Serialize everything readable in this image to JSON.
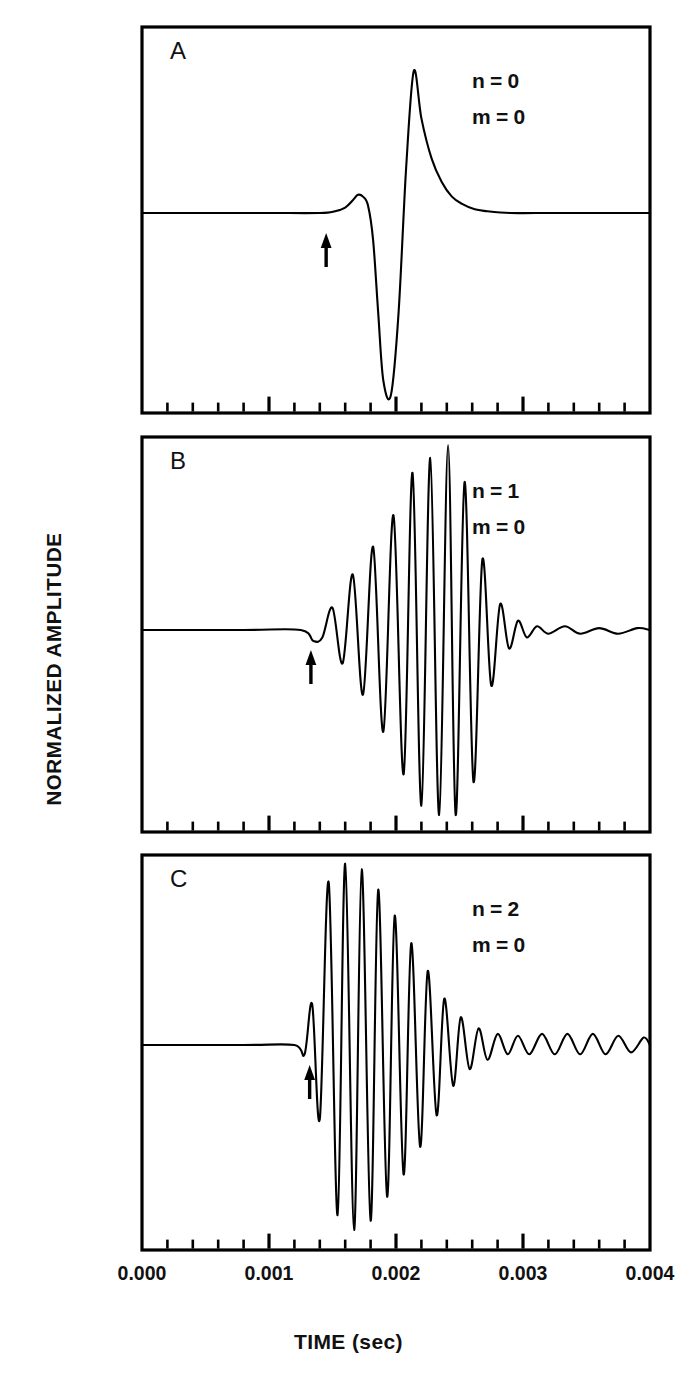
{
  "figure": {
    "axis_titles": {
      "y": "NORMALIZED AMPLITUDE",
      "x": "TIME (sec)"
    }
  },
  "chart_data": {
    "type": "line",
    "title": "",
    "xlabel": "TIME (sec)",
    "ylabel": "NORMALIZED AMPLITUDE",
    "xlim": [
      0.0,
      0.004
    ],
    "ylim": [
      -1.0,
      1.0
    ],
    "grid": false,
    "legend": "none",
    "xticks": [
      "0.000",
      "0.001",
      "0.002",
      "0.003",
      "0.004"
    ],
    "xtick_values": [
      0.0,
      0.001,
      0.002,
      0.003,
      0.004
    ],
    "minor_tick_interval": 0.0002,
    "yticks": [],
    "panels": [
      {
        "letter": "A",
        "n_label": "n = 0",
        "m_label": "m = 0",
        "arrow_time": 0.00145,
        "description": "single bipolar pulse, non-dispersive head wave",
        "x": [
          0.0,
          0.0005,
          0.001,
          0.0014,
          0.00152,
          0.0016,
          0.00166,
          0.0017,
          0.00174,
          0.00178,
          0.00182,
          0.00186,
          0.0019,
          0.00196,
          0.00202,
          0.00208,
          0.00214,
          0.0022,
          0.00228,
          0.00236,
          0.00244,
          0.00252,
          0.00262,
          0.00272,
          0.0029,
          0.0031,
          0.0035,
          0.004
        ],
        "y": [
          0.0,
          0.0,
          0.0,
          0.0,
          0.01,
          0.03,
          0.07,
          0.1,
          0.09,
          0.04,
          -0.15,
          -0.55,
          -0.92,
          -1.0,
          -0.55,
          0.25,
          0.78,
          0.52,
          0.3,
          0.17,
          0.09,
          0.05,
          0.02,
          0.01,
          0.0,
          0.0,
          0.0,
          0.0
        ]
      },
      {
        "letter": "B",
        "n_label": "n = 1",
        "m_label": "m = 0",
        "arrow_time": 0.00133,
        "description": "dispersive wave train, first higher mode, Airy phase near 0.0025 s",
        "envelope_peak_time": 0.00247,
        "x": [
          0.0,
          0.0008,
          0.00125,
          0.00135,
          0.00142,
          0.0015,
          0.00158,
          0.00166,
          0.00174,
          0.00182,
          0.0019,
          0.00198,
          0.00206,
          0.00213,
          0.0022,
          0.00227,
          0.00234,
          0.00241,
          0.00247,
          0.00254,
          0.00261,
          0.00268,
          0.00275,
          0.00282,
          0.00289,
          0.00296,
          0.00303,
          0.00311,
          0.0032,
          0.00333,
          0.00345,
          0.0036,
          0.00375,
          0.0039,
          0.004
        ],
        "y": [
          0.0,
          0.0,
          0.0,
          -0.06,
          -0.04,
          0.12,
          -0.18,
          0.3,
          -0.35,
          0.45,
          -0.55,
          0.62,
          -0.78,
          0.85,
          -0.95,
          0.93,
          -1.0,
          1.0,
          -1.0,
          0.8,
          -0.82,
          0.38,
          -0.3,
          0.14,
          -0.1,
          0.05,
          -0.04,
          0.02,
          -0.02,
          0.02,
          -0.02,
          0.01,
          -0.02,
          0.01,
          0.0
        ]
      },
      {
        "letter": "C",
        "n_label": "n = 2",
        "m_label": "m = 0",
        "arrow_time": 0.00132,
        "description": "dispersive wave train, second higher mode, early Airy phase near 0.0018 s with long low-amplitude coda",
        "envelope_peak_time": 0.0018,
        "x": [
          0.0,
          0.0008,
          0.0012,
          0.00128,
          0.00134,
          0.0014,
          0.00147,
          0.00154,
          0.0016,
          0.00167,
          0.00173,
          0.0018,
          0.00186,
          0.00193,
          0.00199,
          0.00206,
          0.00212,
          0.00219,
          0.00225,
          0.00232,
          0.00238,
          0.00245,
          0.00251,
          0.00258,
          0.00265,
          0.00272,
          0.0028,
          0.00288,
          0.00296,
          0.00305,
          0.00315,
          0.00325,
          0.00335,
          0.00345,
          0.00355,
          0.00365,
          0.00375,
          0.00385,
          0.00395,
          0.004
        ],
        "y": [
          0.0,
          0.0,
          0.0,
          -0.05,
          0.22,
          -0.4,
          0.88,
          -0.92,
          0.98,
          -1.0,
          0.95,
          -0.95,
          0.84,
          -0.82,
          0.7,
          -0.7,
          0.55,
          -0.55,
          0.4,
          -0.38,
          0.25,
          -0.22,
          0.15,
          -0.13,
          0.09,
          -0.08,
          0.06,
          -0.05,
          0.05,
          -0.05,
          0.06,
          -0.05,
          0.06,
          -0.05,
          0.06,
          -0.05,
          0.05,
          -0.04,
          0.04,
          0.0
        ]
      }
    ]
  }
}
